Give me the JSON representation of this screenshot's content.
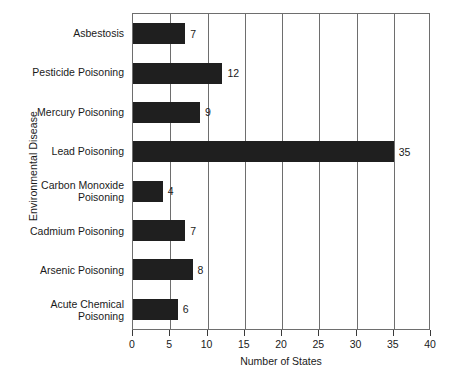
{
  "chart_data": {
    "type": "bar",
    "orientation": "horizontal",
    "title": "",
    "xlabel": "Number of States",
    "ylabel": "Environmental Disease",
    "categories": [
      "Asbestosis",
      "Pesticide Poisoning",
      "Mercury Poisoning",
      "Lead Poisoning",
      "Carbon Monoxide\nPoisoning",
      "Cadmium Poisoning",
      "Arsenic Poisoning",
      "Acute Chemical\nPoisoning"
    ],
    "values": [
      7,
      12,
      9,
      35,
      4,
      7,
      8,
      6
    ],
    "value_labels": [
      "7",
      "12",
      "9",
      "35",
      "4",
      "7",
      "8",
      "6"
    ],
    "xlim": [
      0,
      40
    ],
    "xticks": [
      0,
      5,
      10,
      15,
      20,
      25,
      30,
      35,
      40
    ],
    "xtick_labels": [
      "0",
      "5",
      "10",
      "15",
      "20",
      "25",
      "30",
      "35",
      "40"
    ],
    "grid": "vertical",
    "legend": null,
    "bar_color": "#1f1f1f",
    "axis_color": "#6e6e6e",
    "text_color": "#1a1a1a",
    "background": "#ffffff"
  }
}
